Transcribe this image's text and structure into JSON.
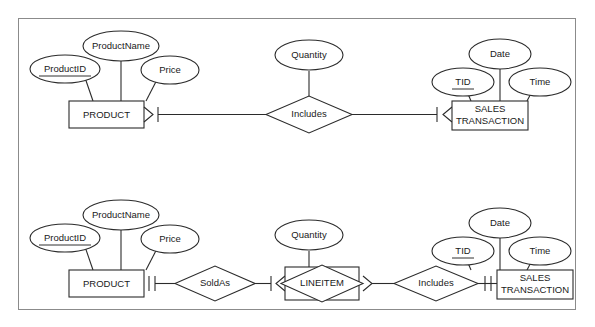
{
  "figure": {
    "border_color": "#8b8b8b",
    "background": "#ffffff",
    "line_color": "#2b2b2b"
  },
  "diagrams": [
    {
      "id": "top-diagram",
      "name": "product-includes-sales-transaction",
      "entities": [
        {
          "id": "product-top",
          "label": "PRODUCT",
          "kind": "entity"
        },
        {
          "id": "sales-transaction-top",
          "label": "SALES\nTRANSACTION",
          "line1": "SALES",
          "line2": "TRANSACTION",
          "kind": "entity"
        }
      ],
      "relationships": [
        {
          "id": "includes-top",
          "label": "Includes",
          "kind": "relationship"
        }
      ],
      "attributes": [
        {
          "id": "product-name-top",
          "label": "ProductName",
          "key": false,
          "owner": "product-top"
        },
        {
          "id": "product-id-top",
          "label": "ProductID",
          "key": true,
          "owner": "product-top"
        },
        {
          "id": "price-top",
          "label": "Price",
          "key": false,
          "owner": "product-top"
        },
        {
          "id": "quantity-top",
          "label": "Quantity",
          "key": false,
          "owner": "includes-top"
        },
        {
          "id": "tid-top",
          "label": "TID",
          "key": true,
          "owner": "sales-transaction-top"
        },
        {
          "id": "date-top",
          "label": "Date",
          "key": false,
          "owner": "sales-transaction-top"
        },
        {
          "id": "time-top",
          "label": "Time",
          "key": false,
          "owner": "sales-transaction-top"
        }
      ],
      "cardinalities": [
        {
          "id": "product-top-to-includes",
          "notation": "one-or-many",
          "end": "product-top"
        },
        {
          "id": "sales-top-to-includes",
          "notation": "one-or-many",
          "end": "sales-transaction-top"
        }
      ]
    },
    {
      "id": "bottom-diagram",
      "name": "product-soldas-lineitem-includes-sales-transaction",
      "entities": [
        {
          "id": "product-bottom",
          "label": "PRODUCT",
          "kind": "entity"
        },
        {
          "id": "lineitem-bottom",
          "label": "LINEITEM",
          "kind": "associative-entity"
        },
        {
          "id": "sales-transaction-bottom",
          "label": "SALES\nTRANSACTION",
          "line1": "SALES",
          "line2": "TRANSACTION",
          "kind": "entity"
        }
      ],
      "relationships": [
        {
          "id": "soldas-bottom",
          "label": "SoldAs",
          "kind": "relationship"
        },
        {
          "id": "includes-bottom",
          "label": "Includes",
          "kind": "relationship"
        }
      ],
      "attributes": [
        {
          "id": "product-name-bottom",
          "label": "ProductName",
          "key": false,
          "owner": "product-bottom"
        },
        {
          "id": "product-id-bottom",
          "label": "ProductID",
          "key": true,
          "owner": "product-bottom"
        },
        {
          "id": "price-bottom",
          "label": "Price",
          "key": false,
          "owner": "product-bottom"
        },
        {
          "id": "quantity-bottom",
          "label": "Quantity",
          "key": false,
          "owner": "lineitem-bottom"
        },
        {
          "id": "tid-bottom",
          "label": "TID",
          "key": true,
          "owner": "sales-transaction-bottom"
        },
        {
          "id": "date-bottom",
          "label": "Date",
          "key": false,
          "owner": "sales-transaction-bottom"
        },
        {
          "id": "time-bottom",
          "label": "Time",
          "key": false,
          "owner": "sales-transaction-bottom"
        }
      ],
      "cardinalities": [
        {
          "id": "product-bottom-to-soldas",
          "notation": "exactly-one",
          "end": "product-bottom"
        },
        {
          "id": "lineitem-left-to-soldas",
          "notation": "one-or-many",
          "end": "lineitem-bottom"
        },
        {
          "id": "lineitem-right-to-includes",
          "notation": "one-or-many",
          "end": "lineitem-bottom"
        },
        {
          "id": "sales-bottom-to-includes",
          "notation": "exactly-one",
          "end": "sales-transaction-bottom"
        }
      ]
    }
  ]
}
